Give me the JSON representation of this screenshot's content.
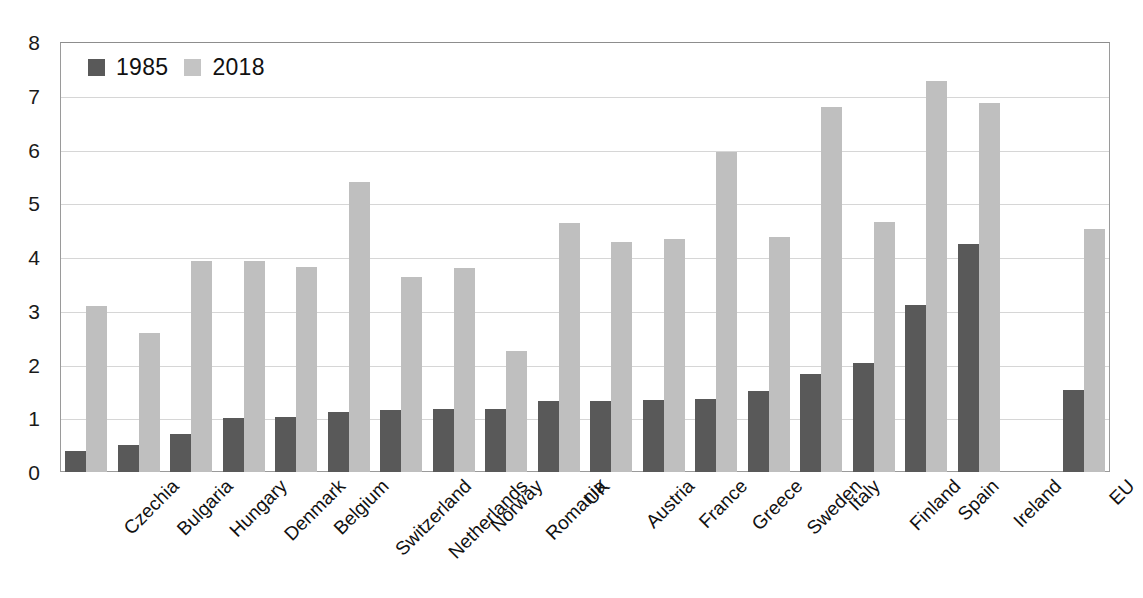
{
  "chart_data": {
    "type": "bar",
    "title": "",
    "subtitle": "",
    "xlabel": "",
    "ylabel": "",
    "ylim": [
      0,
      8
    ],
    "ytick_step": 1,
    "ytick_labels": [
      "0",
      "1",
      "2",
      "3",
      "4",
      "5",
      "6",
      "7",
      "8"
    ],
    "grid": true,
    "legend_position": "top-left",
    "categories": [
      "Czechia",
      "Bulgaria",
      "Hungary",
      "Denmark",
      "Belgium",
      "Switzerland",
      "Netherlands",
      "Norway",
      "Romania",
      "UK",
      "Austria",
      "France",
      "Greece",
      "Sweden",
      "Italy",
      "Finland",
      "Spain",
      "Ireland",
      "",
      "EU"
    ],
    "series": [
      {
        "name": "1985",
        "color": "#595959",
        "values": [
          0.4,
          0.5,
          0.7,
          1.0,
          1.03,
          1.12,
          1.15,
          1.17,
          1.17,
          1.32,
          1.32,
          1.34,
          1.36,
          1.5,
          1.82,
          2.03,
          3.1,
          4.25,
          null,
          1.53
        ]
      },
      {
        "name": "2018",
        "color": "#bfbfbf",
        "values": [
          3.08,
          2.58,
          3.92,
          3.92,
          3.82,
          5.4,
          3.62,
          3.8,
          2.25,
          4.63,
          4.28,
          4.33,
          5.95,
          4.37,
          6.8,
          4.65,
          7.27,
          6.87,
          null,
          4.53
        ]
      }
    ]
  },
  "legend": {
    "entries": [
      {
        "label": "1985",
        "swatch": "dark-gray-swatch"
      },
      {
        "label": "2018",
        "swatch": "light-gray-swatch"
      }
    ]
  },
  "colors": {
    "series_1985": "#595959",
    "series_2018": "#bfbfbf",
    "gridline": "#d6d6d6",
    "axis": "#9a9a9a",
    "background": "#ffffff",
    "text": "#111111"
  }
}
